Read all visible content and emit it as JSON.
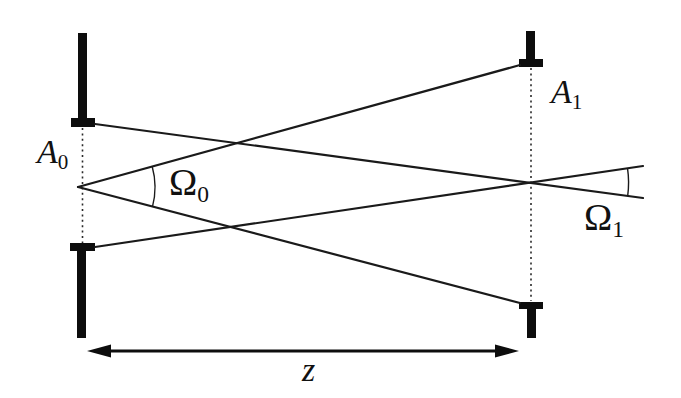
{
  "figure": {
    "kind": "optics-radiometry-diagram",
    "background_color": "#ffffff",
    "ink_color": "#111111"
  },
  "labels": {
    "aperture_left": {
      "main": "A",
      "sub": "0"
    },
    "aperture_right": {
      "main": "A",
      "sub": "1"
    },
    "solid_angle_left": {
      "main": "Ω",
      "sub": "0"
    },
    "solid_angle_right": {
      "main": "Ω",
      "sub": "1"
    },
    "distance": {
      "main": "z"
    }
  }
}
